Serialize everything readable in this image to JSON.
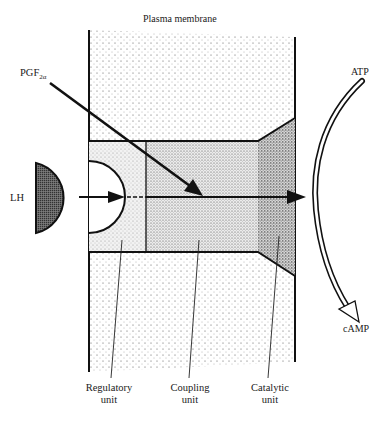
{
  "title": "Plasma membrane",
  "ligands": {
    "pgf": {
      "base": "PGF",
      "subscript": "2α"
    },
    "lh": "LH"
  },
  "substrate": "ATP",
  "product": "cAMP",
  "units": [
    {
      "line1": "Regulatory",
      "line2": "unit"
    },
    {
      "line1": "Coupling",
      "line2": "unit"
    },
    {
      "line1": "Catalytic",
      "line2": "unit"
    }
  ],
  "colors": {
    "ink": "#111111",
    "membrane_fill": "#f4f4f4",
    "regulatory_fill": "#e6e6e6",
    "coupling_fill": "#d8d8d8",
    "catalytic_fill": "#bdbdbd",
    "lh_fill": "#5a5a5a"
  }
}
